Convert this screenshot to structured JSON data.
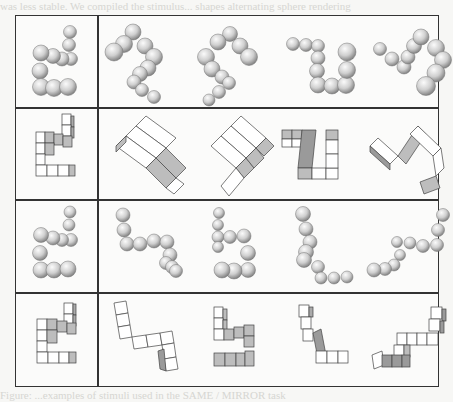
{
  "page": {
    "bleed_through_top": "was less stable. We compiled the stimulus... shapes alternating sphere rendering",
    "bleed_through_bottom": "Figure: ...examples of stimuli used in the SAME / MIRROR task"
  },
  "figure": {
    "rows": [
      {
        "type": "spheres",
        "reference": "sphere-chain-ref-1",
        "comparisons": [
          "sphere-chain-1a",
          "sphere-chain-1b",
          "sphere-chain-1c",
          "sphere-chain-1d"
        ]
      },
      {
        "type": "cubes",
        "reference": "cube-figure-ref-2",
        "comparisons": [
          "cube-figure-2a",
          "cube-figure-2b",
          "cube-figure-2c",
          "cube-figure-2d"
        ]
      },
      {
        "type": "spheres",
        "reference": "sphere-chain-ref-3",
        "comparisons": [
          "sphere-chain-3a",
          "sphere-chain-3b",
          "sphere-chain-3c",
          "sphere-chain-3d"
        ]
      },
      {
        "type": "cubes",
        "reference": "cube-figure-ref-4",
        "comparisons": [
          "cube-figure-4a",
          "cube-figure-4b",
          "cube-figure-4c",
          "cube-figure-4d"
        ]
      }
    ],
    "colors": {
      "border": "#333333",
      "sphere_light": "#f2f2f2",
      "sphere_dark": "#8a8a8a",
      "cube_face": "#ffffff",
      "cube_shade": "#bdbdbd",
      "cube_dark": "#9a9a9a"
    }
  }
}
